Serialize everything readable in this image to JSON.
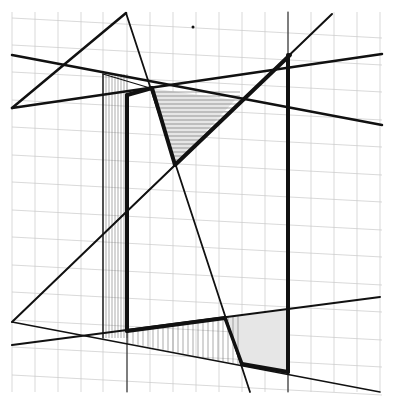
{
  "drawing": {
    "width": 395,
    "height": 401,
    "background": "#ffffff",
    "ink_color": "#111111",
    "grid_color": "#c8c8c8",
    "shade_color": "#e6e6e6",
    "grid": {
      "vertical_x": [
        12,
        35,
        58,
        81,
        103,
        127,
        150,
        173,
        196,
        219,
        242,
        265,
        288,
        311,
        334,
        357,
        380
      ],
      "slanted_rows_left_y": [
        18,
        45,
        72,
        100,
        127,
        155,
        182,
        210,
        237,
        265,
        292,
        320,
        347,
        375
      ],
      "slant_dy": 20,
      "top": 12,
      "bottom": 392,
      "left": 12,
      "right": 382
    },
    "shaded_regions": [
      {
        "name": "upper-shaded-triangle",
        "points": "150,88 235,100 175,165"
      },
      {
        "name": "lower-shaded-triangle",
        "points": "225,318 288,310 288,372 240,365"
      }
    ],
    "hatch_regions": [
      {
        "name": "left-vertical-hatch",
        "x_from": 103,
        "x_to": 127,
        "y_top": 74,
        "y_bottom": 338,
        "step": 3
      },
      {
        "name": "bottom-vertical-hatch",
        "x_from": 128,
        "x_to": 240,
        "top_line": [
          128,
          331,
          225,
          318
        ],
        "bottom_line": [
          103,
          338,
          240,
          365
        ],
        "step": 5
      },
      {
        "name": "top-horizontal-hatch",
        "y_from": 92,
        "y_to": 160,
        "step": 4
      }
    ],
    "lines": [
      {
        "name": "apex-left-edge",
        "x1": 12,
        "y1": 108,
        "x2": 126,
        "y2": 13,
        "w": 2.5
      },
      {
        "name": "apex-long-diagonal",
        "x1": 126,
        "y1": 13,
        "x2": 250,
        "y2": 392,
        "w": 1.8
      },
      {
        "name": "upper-horizon-line",
        "x1": 12,
        "y1": 108,
        "x2": 382,
        "y2": 54,
        "w": 2.5
      },
      {
        "name": "lower-slant-line",
        "x1": 12,
        "y1": 55,
        "x2": 382,
        "y2": 125,
        "w": 2.5
      },
      {
        "name": "main-diagonal",
        "x1": 12,
        "y1": 322,
        "x2": 332,
        "y2": 14,
        "w": 2
      },
      {
        "name": "ground-line",
        "x1": 12,
        "y1": 345,
        "x2": 380,
        "y2": 297,
        "w": 2
      },
      {
        "name": "floor-back-line",
        "x1": 12,
        "y1": 322,
        "x2": 380,
        "y2": 392,
        "w": 1.5
      },
      {
        "name": "faint-diagonal",
        "x1": 175,
        "y1": 165,
        "x2": 105,
        "y2": 232,
        "w": 0.8
      },
      {
        "name": "box-left-thin-vertical",
        "x1": 103,
        "y1": 74,
        "x2": 103,
        "y2": 338,
        "w": 1.3
      },
      {
        "name": "box-top-thin",
        "x1": 103,
        "y1": 74,
        "x2": 150,
        "y2": 88,
        "w": 1.3
      },
      {
        "name": "inner-vertical-thin",
        "x1": 127,
        "y1": 331,
        "x2": 127,
        "y2": 392,
        "w": 1
      },
      {
        "name": "right-vertical-thin",
        "x1": 288,
        "y1": 12,
        "x2": 288,
        "y2": 392,
        "w": 1
      }
    ],
    "bold_lines": [
      {
        "name": "bold-inner-vertical",
        "x1": 127,
        "y1": 95,
        "x2": 127,
        "y2": 331,
        "w": 4
      },
      {
        "name": "bold-top-bar",
        "x1": 127,
        "y1": 95,
        "x2": 152,
        "y2": 88,
        "w": 4
      },
      {
        "name": "bold-v-left",
        "x1": 152,
        "y1": 88,
        "x2": 175,
        "y2": 165,
        "w": 4
      },
      {
        "name": "bold-v-right",
        "x1": 175,
        "y1": 165,
        "x2": 290,
        "y2": 55,
        "w": 4
      },
      {
        "name": "bold-right-vertical",
        "x1": 288,
        "y1": 55,
        "x2": 288,
        "y2": 372,
        "w": 4
      },
      {
        "name": "bold-bottom-bar",
        "x1": 127,
        "y1": 331,
        "x2": 225,
        "y2": 318,
        "w": 4
      },
      {
        "name": "bold-lower-diagonal",
        "x1": 225,
        "y1": 318,
        "x2": 242,
        "y2": 364,
        "w": 3.5
      },
      {
        "name": "bold-floor-bar",
        "x1": 242,
        "y1": 364,
        "x2": 288,
        "y2": 372,
        "w": 4
      }
    ],
    "marks": [
      {
        "name": "pencil-dot",
        "cx": 193,
        "cy": 27,
        "r": 1.5
      }
    ]
  }
}
